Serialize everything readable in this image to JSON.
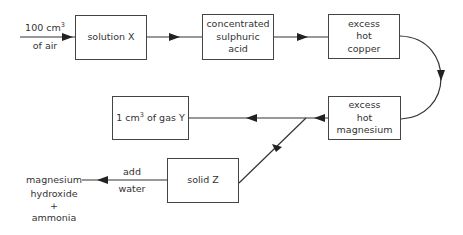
{
  "diagram": {
    "type": "flow",
    "input": {
      "amount": "100 cm",
      "unit_sup": "3",
      "label": "of air"
    },
    "boxes": {
      "solution_x": {
        "lines": [
          "solution X"
        ]
      },
      "sulphuric_acid": {
        "lines": [
          "concentrated",
          "sulphuric",
          "acid"
        ]
      },
      "hot_copper": {
        "lines": [
          "excess",
          "hot",
          "copper"
        ]
      },
      "hot_magnesium": {
        "lines": [
          "excess",
          "hot",
          "magnesium"
        ]
      },
      "gas_y": {
        "prefix": "1 cm",
        "sup": "3",
        "suffix": " of gas Y"
      },
      "solid_z": {
        "lines": [
          "solid Z"
        ]
      }
    },
    "step_label": {
      "lines": [
        "add",
        "water"
      ]
    },
    "products": {
      "lines": [
        "magnesium",
        "hydroxide",
        "+",
        "ammonia"
      ]
    },
    "edges": [
      {
        "from": "input",
        "to": "solution_x"
      },
      {
        "from": "solution_x",
        "to": "sulphuric_acid"
      },
      {
        "from": "sulphuric_acid",
        "to": "hot_copper"
      },
      {
        "from": "hot_copper",
        "to": "hot_magnesium"
      },
      {
        "from": "hot_magnesium",
        "to": "gas_y"
      },
      {
        "from": "hot_magnesium",
        "to": "solid_z"
      },
      {
        "from": "solid_z",
        "to": "products",
        "label": "add water"
      }
    ],
    "colors": {
      "line": "#333333",
      "box_border": "#444444",
      "text": "#333333"
    }
  }
}
